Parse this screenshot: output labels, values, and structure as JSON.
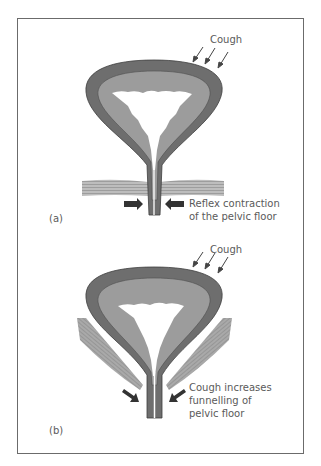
{
  "figure": {
    "panels": [
      {
        "id": "a",
        "label": "(a)",
        "force_label": "Cough",
        "annotation_lines": [
          "Reflex contraction",
          "of the pelvic floor"
        ],
        "description": "Bladder with horizontal pelvic floor muscle; arrows pushing inward on urethra"
      },
      {
        "id": "b",
        "label": "(b)",
        "force_label": "Cough",
        "annotation_lines": [
          "Cough increases",
          "funnelling of",
          "pelvic floor"
        ],
        "description": "Bladder with funnel-shaped pelvic floor muscle; angled arrows pushing down/inward"
      }
    ],
    "colors": {
      "outer_wall": "#6e6e6e",
      "inner_wall": "#9c9c9c",
      "lumen": "#ffffff",
      "muscle": "#a8a8a8",
      "arrow": "#333333",
      "border": "#6b6b6b"
    }
  }
}
